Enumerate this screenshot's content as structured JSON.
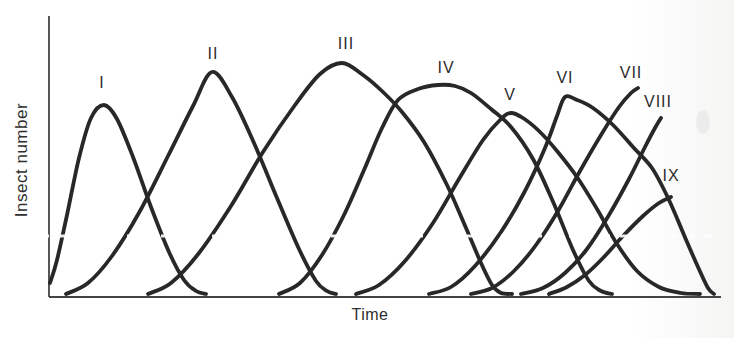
{
  "chart_data": {
    "type": "line",
    "title": "",
    "xlabel": "Time",
    "ylabel": "Insect number",
    "x_tick_labels": [],
    "y_tick_labels": [],
    "grid": false,
    "legend_position": "labels-above-curves",
    "coordinate_space": "pixels_734x338_y_down",
    "axes_px": {
      "origin_x": 49,
      "origin_y": 297,
      "y_top": 16,
      "x_right": 721,
      "color": "#444444",
      "width": 1.8
    },
    "stroke": {
      "color": "#282828",
      "width": 3.8
    },
    "series": [
      {
        "name": "I",
        "label": "I",
        "label_x": 102,
        "label_y": 83,
        "truncated": false,
        "points": [
          [
            50,
            283
          ],
          [
            57,
            260
          ],
          [
            67,
            215
          ],
          [
            79,
            158
          ],
          [
            91,
            118
          ],
          [
            104,
            105
          ],
          [
            117,
            119
          ],
          [
            133,
            157
          ],
          [
            151,
            207
          ],
          [
            169,
            252
          ],
          [
            184,
            280
          ],
          [
            196,
            291
          ],
          [
            206,
            294
          ]
        ]
      },
      {
        "name": "II",
        "label": "II",
        "label_x": 213,
        "label_y": 54,
        "truncated": false,
        "points": [
          [
            66,
            294
          ],
          [
            88,
            283
          ],
          [
            112,
            256
          ],
          [
            140,
            211
          ],
          [
            168,
            156
          ],
          [
            193,
            106
          ],
          [
            212,
            72
          ],
          [
            232,
            97
          ],
          [
            254,
            143
          ],
          [
            277,
            198
          ],
          [
            299,
            249
          ],
          [
            316,
            281
          ],
          [
            327,
            291
          ],
          [
            336,
            294
          ]
        ]
      },
      {
        "name": "III",
        "label": "III",
        "label_x": 346,
        "label_y": 44,
        "truncated": false,
        "points": [
          [
            148,
            294
          ],
          [
            171,
            283
          ],
          [
            199,
            253
          ],
          [
            231,
            206
          ],
          [
            263,
            152
          ],
          [
            295,
            105
          ],
          [
            320,
            74
          ],
          [
            342,
            63
          ],
          [
            363,
            75
          ],
          [
            383,
            92
          ],
          [
            402,
            112
          ],
          [
            424,
            142
          ],
          [
            447,
            185
          ],
          [
            466,
            228
          ],
          [
            481,
            263
          ],
          [
            492,
            285
          ],
          [
            501,
            293
          ],
          [
            512,
            294
          ]
        ]
      },
      {
        "name": "IV",
        "label": "IV",
        "label_x": 446,
        "label_y": 68,
        "truncated": false,
        "points": [
          [
            279,
            294
          ],
          [
            300,
            283
          ],
          [
            322,
            255
          ],
          [
            344,
            215
          ],
          [
            364,
            170
          ],
          [
            382,
            128
          ],
          [
            398,
            100
          ],
          [
            418,
            89
          ],
          [
            438,
            85
          ],
          [
            455,
            86
          ],
          [
            471,
            93
          ],
          [
            491,
            109
          ],
          [
            511,
            127
          ],
          [
            533,
            159
          ],
          [
            554,
            204
          ],
          [
            573,
            250
          ],
          [
            589,
            281
          ],
          [
            601,
            291
          ],
          [
            612,
            294
          ]
        ]
      },
      {
        "name": "V",
        "label": "V",
        "label_x": 510,
        "label_y": 95,
        "truncated": false,
        "points": [
          [
            356,
            294
          ],
          [
            379,
            285
          ],
          [
            405,
            261
          ],
          [
            433,
            223
          ],
          [
            459,
            179
          ],
          [
            483,
            140
          ],
          [
            501,
            119
          ],
          [
            511,
            113
          ],
          [
            523,
            118
          ],
          [
            539,
            131
          ],
          [
            557,
            151
          ],
          [
            577,
            177
          ],
          [
            597,
            209
          ],
          [
            617,
            244
          ],
          [
            637,
            271
          ],
          [
            659,
            287
          ],
          [
            681,
            293
          ],
          [
            700,
            294
          ]
        ]
      },
      {
        "name": "VI",
        "label": "VI",
        "label_x": 565,
        "label_y": 78,
        "truncated": false,
        "points": [
          [
            429,
            294
          ],
          [
            451,
            287
          ],
          [
            475,
            266
          ],
          [
            501,
            232
          ],
          [
            525,
            191
          ],
          [
            545,
            148
          ],
          [
            557,
            116
          ],
          [
            565,
            97
          ],
          [
            577,
            100
          ],
          [
            593,
            108
          ],
          [
            613,
            125
          ],
          [
            633,
            147
          ],
          [
            652,
            168
          ],
          [
            669,
            200
          ],
          [
            684,
            235
          ],
          [
            698,
            267
          ],
          [
            708,
            288
          ],
          [
            714,
            294
          ]
        ]
      },
      {
        "name": "VII",
        "label": "VII",
        "label_x": 631,
        "label_y": 73,
        "truncated": true,
        "points": [
          [
            471,
            294
          ],
          [
            492,
            288
          ],
          [
            514,
            271
          ],
          [
            536,
            245
          ],
          [
            558,
            211
          ],
          [
            580,
            171
          ],
          [
            601,
            135
          ],
          [
            619,
            107
          ],
          [
            631,
            93
          ],
          [
            638,
            88
          ]
        ]
      },
      {
        "name": "VIII",
        "label": "VIII",
        "label_x": 658,
        "label_y": 102,
        "truncated": true,
        "points": [
          [
            521,
            294
          ],
          [
            543,
            288
          ],
          [
            565,
            273
          ],
          [
            587,
            249
          ],
          [
            609,
            215
          ],
          [
            629,
            179
          ],
          [
            645,
            147
          ],
          [
            655,
            128
          ],
          [
            661,
            118
          ]
        ]
      },
      {
        "name": "IX",
        "label": "IX",
        "label_x": 671,
        "label_y": 176,
        "truncated": true,
        "points": [
          [
            549,
            294
          ],
          [
            567,
            287
          ],
          [
            585,
            275
          ],
          [
            603,
            258
          ],
          [
            623,
            236
          ],
          [
            643,
            216
          ],
          [
            659,
            203
          ],
          [
            671,
            197
          ]
        ]
      }
    ],
    "artifacts": {
      "white_dash_line": {
        "y": 236,
        "x1": 42,
        "x2": 722,
        "dash": "7 10",
        "width": 3,
        "opacity": 0.9
      },
      "smudge": {
        "x": 703,
        "y": 122,
        "rx": 7,
        "ry": 12,
        "opacity": 0.1,
        "color": "#8a8a8a"
      }
    }
  }
}
